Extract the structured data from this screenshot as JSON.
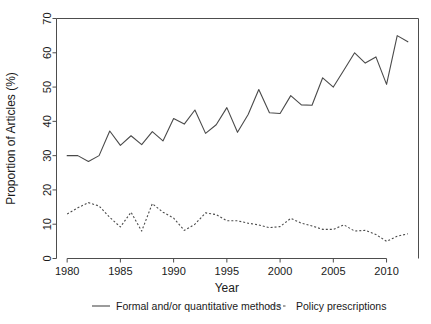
{
  "chart_data": {
    "type": "line",
    "title": "",
    "xlabel": "Year",
    "ylabel": "Proportion of Articles (%)",
    "xlim": [
      1979,
      2013
    ],
    "ylim": [
      0,
      70
    ],
    "xticks": [
      1980,
      1985,
      1990,
      1995,
      2000,
      2005,
      2010
    ],
    "yticks": [
      0,
      10,
      20,
      30,
      40,
      50,
      60,
      70
    ],
    "grid": false,
    "legend_position": "below-axes",
    "x": [
      1980,
      1981,
      1982,
      1983,
      1984,
      1985,
      1986,
      1987,
      1988,
      1989,
      1990,
      1991,
      1992,
      1993,
      1994,
      1995,
      1996,
      1997,
      1998,
      1999,
      2000,
      2001,
      2002,
      2003,
      2004,
      2005,
      2006,
      2007,
      2008,
      2009,
      2010,
      2011,
      2012
    ],
    "series": [
      {
        "name": "Formal and/or quantitative methods",
        "style": "solid",
        "color": "#4a4a4a",
        "values": [
          30.0,
          30.0,
          28.3,
          30.0,
          37.2,
          33.0,
          35.8,
          33.2,
          37.0,
          34.3,
          40.8,
          39.2,
          43.3,
          36.5,
          39.0,
          44.0,
          36.8,
          42.0,
          49.3,
          42.5,
          42.3,
          47.5,
          44.8,
          44.7,
          52.7,
          50.0,
          55.0,
          60.0,
          57.0,
          58.8,
          50.8,
          65.0,
          63.2
        ]
      },
      {
        "name": "Policy prescriptions",
        "style": "dashed",
        "color": "#4a4a4a",
        "values": [
          13.0,
          14.8,
          16.3,
          15.3,
          12.0,
          9.2,
          13.5,
          8.0,
          16.0,
          13.5,
          11.8,
          8.2,
          10.0,
          13.3,
          12.8,
          11.0,
          11.0,
          10.3,
          9.8,
          9.0,
          9.3,
          11.7,
          10.3,
          9.5,
          8.5,
          8.5,
          9.8,
          8.0,
          8.2,
          7.0,
          5.0,
          6.5,
          7.2
        ]
      }
    ],
    "legend": [
      {
        "label": "Formal and/or quantitative methods",
        "style": "solid"
      },
      {
        "label": "Policy prescriptions",
        "style": "dashed"
      }
    ]
  }
}
